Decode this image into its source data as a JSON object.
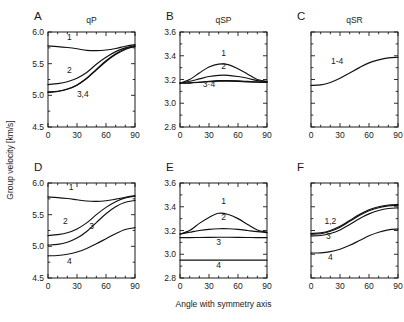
{
  "figure": {
    "xlabel": "Angle with symmetry axis",
    "ylabel": "Group velocity [km/s]"
  },
  "chart_data": {
    "type": "line",
    "title": "",
    "xlabel": "Angle with symmetry axis",
    "ylabel": "Group velocity [km/s]",
    "grid": false,
    "legend_position": "inline-curve-labels",
    "x": [
      0,
      10,
      20,
      30,
      40,
      50,
      60,
      70,
      80,
      90
    ],
    "xlim": [
      0,
      90
    ],
    "xticks": [
      0,
      30,
      60,
      90
    ],
    "xminor_ticks": [
      10,
      20,
      40,
      50,
      70,
      80
    ],
    "panels": [
      {
        "letter": "A",
        "title": "qP",
        "ylim": [
          4.5,
          6.0
        ],
        "yticks": [
          4.5,
          5.0,
          5.5,
          6.0
        ],
        "ytick_labels": [
          "4.5",
          "5.0",
          "5.5",
          "6.0"
        ],
        "show_ytick_labels": true,
        "series": [
          {
            "name": "1",
            "label": "1",
            "label_x": 22,
            "label_y": 5.88,
            "values": [
              5.78,
              5.77,
              5.755,
              5.735,
              5.71,
              5.705,
              5.715,
              5.74,
              5.775,
              5.8
            ]
          },
          {
            "name": "2",
            "label": "2",
            "label_x": 22,
            "label_y": 5.36,
            "values": [
              5.17,
              5.185,
              5.215,
              5.27,
              5.36,
              5.49,
              5.6,
              5.69,
              5.75,
              5.785
            ]
          },
          {
            "name": "3",
            "label": "3,4",
            "label_x": 36,
            "label_y": 4.97,
            "values": [
              5.055,
              5.065,
              5.1,
              5.165,
              5.27,
              5.41,
              5.545,
              5.655,
              5.735,
              5.775
            ]
          },
          {
            "name": "4",
            "label": "",
            "label_x": 0,
            "label_y": 0,
            "values": [
              5.045,
              5.06,
              5.095,
              5.16,
              5.265,
              5.4,
              5.535,
              5.645,
              5.725,
              5.77
            ]
          }
        ]
      },
      {
        "letter": "B",
        "title": "qSP",
        "ylim": [
          2.8,
          3.6
        ],
        "yticks": [
          2.8,
          3.0,
          3.2,
          3.4,
          3.6
        ],
        "ytick_labels": [
          "2.8",
          "3.0",
          "3.2",
          "3.4",
          "3.6"
        ],
        "show_ytick_labels": true,
        "series": [
          {
            "name": "1",
            "label": "1",
            "label_x": 45,
            "label_y": 3.4,
            "values": [
              3.17,
              3.2,
              3.255,
              3.305,
              3.33,
              3.325,
              3.29,
              3.245,
              3.2,
              3.185
            ]
          },
          {
            "name": "2",
            "label": "2",
            "label_x": 45,
            "label_y": 3.285,
            "values": [
              3.17,
              3.185,
              3.205,
              3.225,
              3.235,
              3.235,
              3.225,
              3.21,
              3.19,
              3.182
            ]
          },
          {
            "name": "3",
            "label": "3·4",
            "label_x": 30,
            "label_y": 3.135,
            "values": [
              3.17,
              3.172,
              3.178,
              3.185,
              3.19,
              3.19,
              3.188,
              3.184,
              3.18,
              3.178
            ]
          },
          {
            "name": "4",
            "label": "",
            "label_x": 0,
            "label_y": 0,
            "values": [
              3.168,
              3.17,
              3.175,
              3.181,
              3.186,
              3.186,
              3.184,
              3.18,
              3.177,
              3.175
            ]
          }
        ]
      },
      {
        "letter": "C",
        "title": "qSR",
        "ylim": [
          2.8,
          3.6
        ],
        "yticks": [
          2.8,
          3.0,
          3.2,
          3.4,
          3.6
        ],
        "ytick_labels": [],
        "show_ytick_labels": false,
        "series": [
          {
            "name": "1-4",
            "label": "1-4",
            "label_x": 27,
            "label_y": 3.33,
            "values": [
              3.15,
              3.155,
              3.175,
              3.21,
              3.255,
              3.3,
              3.34,
              3.365,
              3.382,
              3.387
            ]
          }
        ]
      },
      {
        "letter": "D",
        "title": "",
        "ylim": [
          4.5,
          6.0
        ],
        "yticks": [
          4.5,
          5.0,
          5.5,
          6.0
        ],
        "ytick_labels": [
          "4.5",
          "5.0",
          "5.5",
          "6.0"
        ],
        "show_ytick_labels": true,
        "series": [
          {
            "name": "1",
            "label": "1",
            "label_x": 24,
            "label_y": 5.89,
            "values": [
              5.78,
              5.77,
              5.755,
              5.735,
              5.715,
              5.71,
              5.72,
              5.745,
              5.775,
              5.8
            ]
          },
          {
            "name": "2",
            "label": "2",
            "label_x": 18,
            "label_y": 5.36,
            "values": [
              5.17,
              5.185,
              5.215,
              5.275,
              5.37,
              5.5,
              5.615,
              5.705,
              5.765,
              5.79
            ]
          },
          {
            "name": "3",
            "label": "3",
            "label_x": 45,
            "label_y": 5.28,
            "values": [
              5.02,
              5.03,
              5.065,
              5.13,
              5.235,
              5.375,
              5.515,
              5.625,
              5.695,
              5.725
            ]
          },
          {
            "name": "4",
            "label": "4",
            "label_x": 22,
            "label_y": 4.72,
            "values": [
              4.85,
              4.855,
              4.875,
              4.91,
              4.965,
              5.04,
              5.12,
              5.2,
              5.265,
              5.295
            ]
          }
        ]
      },
      {
        "letter": "E",
        "title": "",
        "ylim": [
          2.8,
          3.6
        ],
        "yticks": [
          2.8,
          3.0,
          3.2,
          3.4,
          3.6
        ],
        "ytick_labels": [
          "2.8",
          "3.0",
          "3.2",
          "3.4",
          "3.6"
        ],
        "show_ytick_labels": true,
        "series": [
          {
            "name": "1",
            "label": "1",
            "label_x": 45,
            "label_y": 3.42,
            "values": [
              3.17,
              3.2,
              3.26,
              3.31,
              3.345,
              3.335,
              3.3,
              3.25,
              3.205,
              3.185
            ]
          },
          {
            "name": "2",
            "label": "2",
            "label_x": 45,
            "label_y": 3.29,
            "values": [
              3.17,
              3.185,
              3.2,
              3.21,
              3.215,
              3.215,
              3.21,
              3.2,
              3.19,
              3.182
            ]
          },
          {
            "name": "3",
            "label": "3",
            "label_x": 40,
            "label_y": 3.08,
            "values": [
              3.14,
              3.14,
              3.141,
              3.142,
              3.143,
              3.143,
              3.142,
              3.141,
              3.14,
              3.14
            ]
          },
          {
            "name": "4",
            "label": "4",
            "label_x": 40,
            "label_y": 2.885,
            "values": [
              2.95,
              2.95,
              2.95,
              2.95,
              2.95,
              2.95,
              2.95,
              2.95,
              2.95,
              2.95
            ]
          }
        ]
      },
      {
        "letter": "F",
        "title": "",
        "ylim": [
          2.8,
          3.6
        ],
        "yticks": [
          2.8,
          3.0,
          3.2,
          3.4,
          3.6
        ],
        "ytick_labels": [],
        "show_ytick_labels": false,
        "series": [
          {
            "name": "1",
            "label": "1,2",
            "label_x": 20,
            "label_y": 3.255,
            "values": [
              3.175,
              3.18,
              3.2,
              3.235,
              3.285,
              3.335,
              3.375,
              3.4,
              3.415,
              3.42
            ]
          },
          {
            "name": "2",
            "label": "",
            "label_x": 0,
            "label_y": 0,
            "values": [
              3.168,
              3.173,
              3.193,
              3.228,
              3.277,
              3.327,
              3.367,
              3.392,
              3.407,
              3.412
            ]
          },
          {
            "name": "3",
            "label": "3",
            "label_x": 18,
            "label_y": 3.13,
            "values": [
              3.155,
              3.158,
              3.175,
              3.205,
              3.25,
              3.3,
              3.34,
              3.368,
              3.385,
              3.39
            ]
          },
          {
            "name": "4",
            "label": "4",
            "label_x": 20,
            "label_y": 2.955,
            "values": [
              3.01,
              3.012,
              3.022,
              3.042,
              3.075,
              3.115,
              3.155,
              3.185,
              3.205,
              3.212
            ]
          }
        ]
      }
    ]
  }
}
